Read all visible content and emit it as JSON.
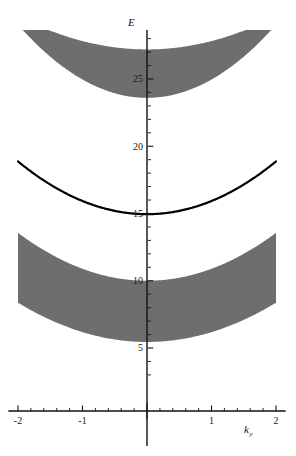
{
  "chart_data": {
    "type": "area",
    "title": "",
    "xlabel": "k_y",
    "ylabel": "E",
    "xlabel_base": "k",
    "xlabel_sub": "y",
    "xlim": [
      -2.15,
      2.15
    ],
    "ylim": [
      2.2,
      29.6
    ],
    "grid": false,
    "legend": null,
    "x_ticks_major": [
      -2,
      -1,
      1,
      2
    ],
    "x_ticks_major_labels": [
      "-2",
      "-1",
      "1",
      "2"
    ],
    "x_tick_major_values": [
      -2,
      -1,
      0,
      1,
      2
    ],
    "x_ticks_minor_step": 0.2,
    "y_ticks_major": [
      5,
      10,
      15,
      20,
      25
    ],
    "y_ticks_major_labels": [
      "5",
      "10",
      "15",
      "20",
      "25"
    ],
    "y_ticks_minor_step": 1,
    "colors": {
      "band_fill": "#6e6e6e",
      "curve": "#000000",
      "axis": "#111111",
      "background": "#ffffff",
      "text": "#1a1a1a"
    },
    "series": [
      {
        "name": "upper-band-continuum",
        "kind": "band",
        "shading": "filled",
        "color": "#6e6e6e",
        "upper_curve": {
          "form": "quadratic",
          "vertex_y": 27.2,
          "curvature": 0.62
        },
        "lower_curve": {
          "form": "quadratic",
          "vertex_y": 23.6,
          "curvature": 1.36
        },
        "x_samples": [
          -2,
          -1.5,
          -1,
          -0.5,
          0,
          0.5,
          1,
          1.5,
          2
        ],
        "upper_values": [
          29.68,
          28.6,
          27.82,
          27.36,
          27.2,
          27.36,
          27.82,
          28.6,
          29.68
        ],
        "lower_values": [
          29.04,
          26.66,
          24.96,
          23.94,
          23.6,
          23.94,
          24.96,
          26.66,
          29.04
        ]
      },
      {
        "name": "middle-band-dispersion",
        "kind": "curve",
        "shading": "line",
        "color": "#000000",
        "curve": {
          "form": "quadratic",
          "vertex_y": 14.95,
          "curvature": 0.98
        },
        "x_samples": [
          -2,
          -1.5,
          -1,
          -0.5,
          0,
          0.5,
          1,
          1.5,
          2
        ],
        "values": [
          18.87,
          17.16,
          15.93,
          15.2,
          14.95,
          15.2,
          15.93,
          17.16,
          18.87
        ]
      },
      {
        "name": "lower-band-continuum",
        "kind": "band",
        "shading": "filled",
        "color": "#6e6e6e",
        "upper_curve": {
          "form": "quadratic",
          "vertex_y": 10.0,
          "curvature": 0.89
        },
        "lower_curve": {
          "form": "quadratic",
          "vertex_y": 5.45,
          "curvature": 0.73
        },
        "x_samples": [
          -2,
          -1.5,
          -1,
          -0.5,
          0,
          0.5,
          1,
          1.5,
          2
        ],
        "upper_values": [
          13.56,
          12.0,
          10.89,
          10.22,
          10.0,
          10.22,
          10.89,
          12.0,
          13.56
        ],
        "lower_values": [
          8.37,
          7.09,
          6.18,
          5.63,
          5.45,
          5.63,
          6.18,
          7.09,
          8.37
        ]
      }
    ],
    "annotations": []
  }
}
